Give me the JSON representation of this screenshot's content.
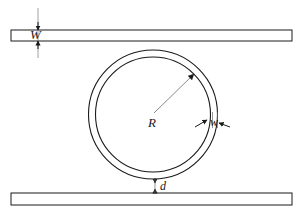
{
  "figure": {
    "kind": "schematic-diagram",
    "background_color": "#ffffff",
    "stroke_color": "#1a1a1a",
    "width_px": 301,
    "height_px": 212
  },
  "labels": {
    "bus_width": "W",
    "ring_radius": "R",
    "ring_width": "w",
    "gap": "d"
  },
  "geometry": {
    "top_bus": {
      "name": "top bus waveguide",
      "x": 11,
      "y": 30,
      "width": 281,
      "height": 11
    },
    "bottom_bus": {
      "name": "bottom bus waveguide",
      "x": 11,
      "y": 193,
      "width": 281,
      "height": 12
    },
    "ring": {
      "name": "ring resonator",
      "center_x": 153,
      "center_y": 114.5,
      "outer_radius": 64.5,
      "inner_radius": 57.5
    },
    "radius_arrow": {
      "from_x": 153,
      "from_y": 114.5,
      "to_x": 194,
      "to_y": 74
    },
    "bus_width_dimension": {
      "line_x": 38,
      "top_y": 8,
      "bottom_y": 58,
      "arrow_top_y": 30,
      "arrow_bottom_y": 41
    },
    "gap_dimension": {
      "line_x": 155,
      "top_y": 179,
      "bottom_y": 193
    },
    "ring_width_dimension": {
      "left_arrow_x": 196,
      "right_arrow_x": 228,
      "y": 122
    }
  },
  "annotations": [
    {
      "id": "W",
      "text": "W",
      "meaning": "bus waveguide width"
    },
    {
      "id": "R",
      "text": "R",
      "meaning": "ring radius"
    },
    {
      "id": "w",
      "text": "w",
      "meaning": "ring waveguide width"
    },
    {
      "id": "d",
      "text": "d",
      "meaning": "coupling gap between ring and bus"
    }
  ]
}
